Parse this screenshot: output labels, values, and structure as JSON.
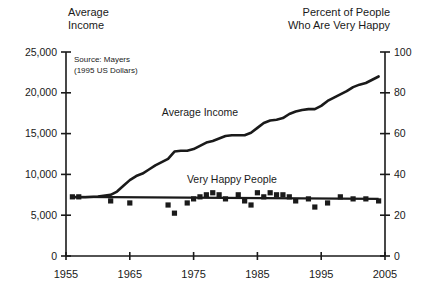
{
  "chart_data": {
    "type": "line",
    "title": "",
    "subtitle": "",
    "source_note_line1": "Source: Mayers",
    "source_note_line2": "(1995 US Dollars)",
    "xlabel": "",
    "ylabel_left_line1": "Average",
    "ylabel_left_line2": "Income",
    "ylabel_right_line1": "Percent of People",
    "ylabel_right_line2": "Who Are Very Happy",
    "xlim": [
      1955,
      2005
    ],
    "ylim_left": [
      0,
      25000
    ],
    "ylim_right": [
      0,
      100
    ],
    "grid": false,
    "legend_position": "inline-annotations",
    "x_ticks": [
      "1955",
      "1965",
      "1975",
      "1985",
      "1995",
      "2005"
    ],
    "x_tick_values": [
      1955,
      1965,
      1975,
      1985,
      1995,
      2005
    ],
    "y_ticks_left": [
      "0",
      "5,000",
      "10,000",
      "15,000",
      "20,000",
      "25,000"
    ],
    "y_tick_values_left": [
      0,
      5000,
      10000,
      15000,
      20000,
      25000
    ],
    "y_ticks_right": [
      "0",
      "20",
      "40",
      "60",
      "80",
      "100"
    ],
    "y_tick_values_right": [
      0,
      20,
      40,
      60,
      80,
      100
    ],
    "annotations": [
      {
        "text": "Average Income",
        "x": 1976,
        "y_left": 17200
      },
      {
        "text": "Very Happy People",
        "x": 1981,
        "y_right": 36
      }
    ],
    "series": [
      {
        "name": "Average Income",
        "axis": "left",
        "style": "line",
        "color": "#1a1a1a",
        "x": [
          1956,
          1958,
          1960,
          1962,
          1963,
          1964,
          1965,
          1966,
          1967,
          1968,
          1969,
          1970,
          1971,
          1972,
          1973,
          1974,
          1975,
          1976,
          1977,
          1978,
          1979,
          1980,
          1981,
          1982,
          1983,
          1984,
          1985,
          1986,
          1987,
          1988,
          1989,
          1990,
          1991,
          1992,
          1993,
          1994,
          1995,
          1996,
          1997,
          1998,
          1999,
          2000,
          2001,
          2002,
          2003,
          2004
        ],
        "values": [
          7200,
          7200,
          7300,
          7500,
          7900,
          8600,
          9300,
          9800,
          10100,
          10600,
          11100,
          11500,
          11900,
          12800,
          12900,
          12900,
          13100,
          13500,
          13900,
          14100,
          14400,
          14700,
          14800,
          14800,
          14800,
          15100,
          15700,
          16300,
          16600,
          16700,
          16900,
          17400,
          17700,
          17900,
          18000,
          18000,
          18400,
          19000,
          19400,
          19800,
          20200,
          20700,
          21000,
          21200,
          21600,
          22000
        ]
      },
      {
        "name": "Very Happy People",
        "axis": "right",
        "style": "scatter",
        "color": "#1a1a1a",
        "x": [
          1956,
          1957,
          1962,
          1965,
          1971,
          1972,
          1974,
          1975,
          1976,
          1977,
          1978,
          1979,
          1980,
          1982,
          1983,
          1984,
          1985,
          1986,
          1987,
          1988,
          1989,
          1990,
          1991,
          1993,
          1994,
          1996,
          1998,
          2000,
          2002,
          2004
        ],
        "values": [
          29,
          29,
          27,
          26,
          25,
          21,
          26,
          28,
          29,
          30,
          31,
          30,
          28,
          30,
          27,
          25,
          31,
          29,
          31,
          30,
          30,
          29,
          27,
          28,
          24,
          26,
          29,
          28,
          28,
          27
        ]
      },
      {
        "name": "Very Happy People Trend",
        "axis": "right",
        "style": "trend-line",
        "color": "#1a1a1a",
        "x": [
          1956,
          2004
        ],
        "values": [
          29.0,
          28.0
        ]
      }
    ]
  }
}
